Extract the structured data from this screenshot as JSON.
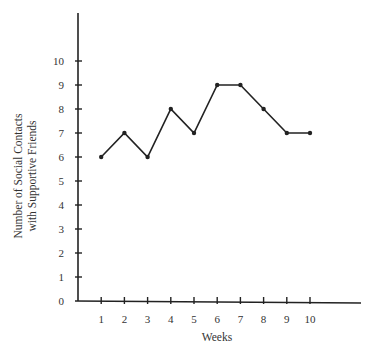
{
  "chart_data": {
    "type": "line",
    "title": "",
    "xlabel": "Weeks",
    "ylabel": "Number of Social Contacts with Supportive Friends",
    "ylabel_lines": [
      "Number of Social Contacts",
      "with Supportive Friends"
    ],
    "x": [
      1,
      2,
      3,
      4,
      5,
      6,
      7,
      8,
      9,
      10
    ],
    "series": [
      {
        "name": "Social contacts",
        "values": [
          6,
          7,
          6,
          8,
          7,
          9,
          9,
          8,
          7,
          7
        ]
      }
    ],
    "x_ticks": [
      "1",
      "2",
      "3",
      "4",
      "5",
      "6",
      "7",
      "8",
      "9",
      "10"
    ],
    "y_ticks": [
      "0",
      "1",
      "2",
      "3",
      "4",
      "5",
      "6",
      "7",
      "8",
      "9",
      "10"
    ],
    "xlim": [
      0,
      12
    ],
    "ylim": [
      0,
      12
    ],
    "grid": false,
    "legend": "none",
    "colors": {
      "line": "#222222",
      "axis": "#222222",
      "text": "#333333"
    }
  }
}
